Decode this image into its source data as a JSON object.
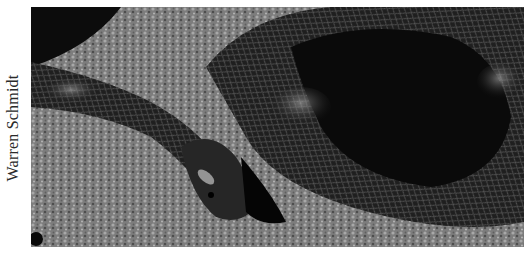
{
  "credit": {
    "text": "Warren Schmidt"
  },
  "photo": {
    "subject": "coiled snake on gravel",
    "colors": {
      "ground": "#8a8a8a",
      "ground_dark": "#555555",
      "snake_body": "#1c1c1c",
      "snake_highlight": "#9a9a9a",
      "shadow": "#050505"
    }
  }
}
